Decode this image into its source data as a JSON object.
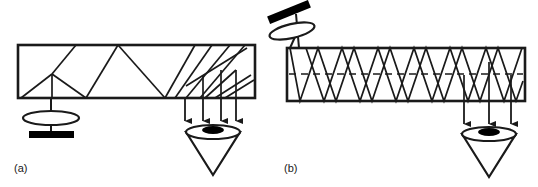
{
  "figure": {
    "type": "optical-ray-diagram",
    "background_color": "#ffffff",
    "line_color": "#1a1a1a",
    "fill_color": "#000000",
    "width": 538,
    "height": 187
  },
  "panels": [
    {
      "id": "a",
      "caption": "(a)",
      "caption_x": 14,
      "caption_y": 172,
      "slab": {
        "x": 18,
        "y": 45,
        "width": 237,
        "height": 53
      },
      "ray_pattern": "irregular",
      "source": {
        "type": "straight",
        "emitter_bar": {
          "x": 29,
          "y": 131,
          "width": 45,
          "height": 7
        },
        "lens_ellipse": {
          "cx": 51,
          "cy": 118,
          "rx": 28,
          "ry": 7
        },
        "stem_x": 51,
        "stem_top": 98,
        "stem_bottom": 134
      },
      "detector": {
        "cone_apex_x": 213,
        "cone_apex_y": 175,
        "rim_cx": 213,
        "rim_cy": 132,
        "rim_rx": 27,
        "rim_ry": 7,
        "patch_rx": 11,
        "patch_ry": 4
      },
      "output_arrows_x": [
        185,
        203,
        221,
        236
      ],
      "arrow_top_y": 98,
      "arrow_tip_y": 124
    },
    {
      "id": "b",
      "caption": "(b)",
      "caption_x": 284,
      "caption_y": 172,
      "slab": {
        "x": 287,
        "y": 48,
        "width": 238,
        "height": 53
      },
      "ray_pattern": "regular-zigzag",
      "zigzag_periods": 13,
      "centerline": {
        "style": "dashed",
        "y": 74
      },
      "source": {
        "type": "tilted",
        "tilt_degrees": -22,
        "emitter_bar": {
          "cx": 289,
          "cy": 12,
          "width": 44,
          "height": 7
        },
        "lens_ellipse": {
          "cx": 292,
          "cy": 31,
          "rx": 23,
          "ry": 7
        },
        "stem_top_x": 296,
        "stem_top_y": 14,
        "stem_bottom_x": 299,
        "stem_bottom_y": 48,
        "entry_ray_x": 290,
        "entry_ray_y": 48
      },
      "detector": {
        "cone_apex_x": 489,
        "cone_apex_y": 177,
        "rim_cx": 489,
        "rim_cy": 134,
        "rim_rx": 27,
        "rim_ry": 7,
        "patch_rx": 11,
        "patch_ry": 4
      },
      "output_arrows_x": [
        464,
        489,
        511
      ],
      "arrow_top_y": 101,
      "arrow_tip_y": 127
    }
  ]
}
